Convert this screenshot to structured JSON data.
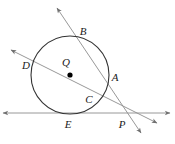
{
  "figure": {
    "type": "geometry-diagram",
    "width": 175,
    "height": 144,
    "background_color": "#ffffff",
    "stroke_color": "#4d4d4d",
    "circle_color": "#333333",
    "label_color": "#1a1a1a",
    "center_dot_color": "#000000"
  },
  "circle": {
    "label": "Q",
    "center_x": 70,
    "center_y": 75,
    "radius": 39
  },
  "points": [
    {
      "name": "A",
      "label": "A",
      "label_x": 115,
      "label_y": 77,
      "x": 107,
      "y": 79,
      "kind": "on-circle"
    },
    {
      "name": "B",
      "label": "B",
      "label_x": 83,
      "label_y": 31,
      "x": 77,
      "y": 39,
      "kind": "on-circle"
    },
    {
      "name": "C",
      "label": "C",
      "label_x": 89,
      "label_y": 99,
      "x": 94,
      "y": 99,
      "kind": "on-circle"
    },
    {
      "name": "D",
      "label": "D",
      "label_x": 26,
      "label_y": 65,
      "x": 34,
      "y": 62,
      "kind": "on-circle"
    },
    {
      "name": "E",
      "label": "E",
      "label_x": 68,
      "label_y": 124,
      "x": 70,
      "y": 114,
      "kind": "tangent-point"
    },
    {
      "name": "P",
      "label": "P",
      "label_x": 122,
      "label_y": 124,
      "x": 122,
      "y": 113,
      "kind": "external-intersection"
    },
    {
      "name": "Q",
      "label": "Q",
      "label_x": 66,
      "label_y": 62,
      "x": 70,
      "y": 75,
      "kind": "center"
    }
  ],
  "lines": [
    {
      "name": "secant-B-C-P",
      "description": "Secant through B and C extending to P and beyond, arrowheads both ends",
      "from_x": 57,
      "from_y": 8,
      "to_x": 141,
      "to_y": 133,
      "arrow_start": true,
      "arrow_end": true
    },
    {
      "name": "secant-D-A-P",
      "description": "Secant through D and A extending to P and beyond, arrowheads both ends",
      "from_x": 11,
      "from_y": 50,
      "to_x": 157,
      "to_y": 123,
      "arrow_start": true,
      "arrow_end": true
    },
    {
      "name": "tangent-E-P",
      "description": "Horizontal tangent line touching circle at E and passing through P",
      "from_x": 3,
      "from_y": 113,
      "to_x": 170,
      "to_y": 113,
      "arrow_start": true,
      "arrow_end": true
    }
  ],
  "labels": {
    "A": "A",
    "B": "B",
    "C": "C",
    "D": "D",
    "E": "E",
    "P": "P",
    "Q": "Q"
  }
}
